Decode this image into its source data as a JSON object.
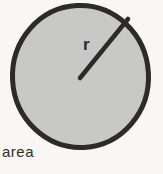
{
  "diagram": {
    "shape": "circle",
    "radius_label": "r",
    "area_label": "area",
    "colors": {
      "background": "#f8f7f4",
      "circle_fill": "#c8c8c6",
      "circle_stroke": "#2d2b28",
      "radius_line": "#2d2b28",
      "text": "#2f2d2a"
    }
  }
}
